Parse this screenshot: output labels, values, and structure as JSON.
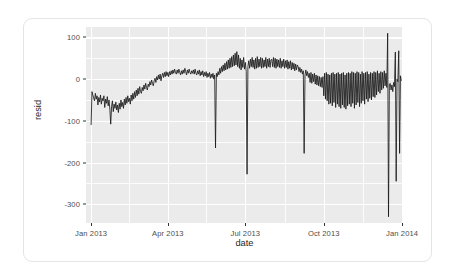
{
  "chart_data": {
    "type": "line",
    "title": "",
    "subtitle": "",
    "xlabel": "date",
    "ylabel": "resid",
    "grid": true,
    "legend": null,
    "xlim": [
      "2012-12-26",
      "2014-01-02"
    ],
    "ylim": [
      -345,
      125
    ],
    "yticks": [
      100,
      0,
      -100,
      -200,
      -300
    ],
    "ytick_labels": [
      "100",
      "0",
      "-100",
      "-200",
      "-300"
    ],
    "xticks": [
      "2013-01-01",
      "2013-04-01",
      "2013-07-01",
      "2013-10-01",
      "2014-01-01"
    ],
    "xtick_labels": [
      "Jan 2013",
      "Apr 2013",
      "Jul 2013",
      "Oct 2013",
      "Jan 2014"
    ],
    "panel_background": "#ebebeb",
    "gridline_color": "#ffffff",
    "line_color": "#1a1a1a",
    "series": [
      {
        "name": "resid",
        "x": [
          "2013-01-01",
          "2013-01-02",
          "2013-01-03",
          "2013-01-04",
          "2013-01-05",
          "2013-01-06",
          "2013-01-07",
          "2013-01-08",
          "2013-01-09",
          "2013-01-10",
          "2013-01-11",
          "2013-01-12",
          "2013-01-13",
          "2013-01-14",
          "2013-01-15",
          "2013-01-16",
          "2013-01-17",
          "2013-01-18",
          "2013-01-19",
          "2013-01-20",
          "2013-01-21",
          "2013-01-22",
          "2013-01-23",
          "2013-01-24",
          "2013-01-25",
          "2013-01-26",
          "2013-01-27",
          "2013-01-28",
          "2013-01-29",
          "2013-01-30",
          "2013-01-31",
          "2013-02-01",
          "2013-02-02",
          "2013-02-03",
          "2013-02-04",
          "2013-02-05",
          "2013-02-06",
          "2013-02-07",
          "2013-02-08",
          "2013-02-09",
          "2013-02-10",
          "2013-02-11",
          "2013-02-12",
          "2013-02-13",
          "2013-02-14",
          "2013-02-15",
          "2013-02-16",
          "2013-02-17",
          "2013-02-18",
          "2013-02-19",
          "2013-02-20",
          "2013-02-21",
          "2013-02-22",
          "2013-02-23",
          "2013-02-24",
          "2013-02-25",
          "2013-02-26",
          "2013-02-27",
          "2013-02-28",
          "2013-03-01",
          "2013-03-02",
          "2013-03-03",
          "2013-03-04",
          "2013-03-05",
          "2013-03-06",
          "2013-03-07",
          "2013-03-08",
          "2013-03-09",
          "2013-03-10",
          "2013-03-11",
          "2013-03-12",
          "2013-03-13",
          "2013-03-14",
          "2013-03-15",
          "2013-03-16",
          "2013-03-17",
          "2013-03-18",
          "2013-03-19",
          "2013-03-20",
          "2013-03-21",
          "2013-03-22",
          "2013-03-23",
          "2013-03-24",
          "2013-03-25",
          "2013-03-26",
          "2013-03-27",
          "2013-03-28",
          "2013-03-29",
          "2013-03-30",
          "2013-03-31",
          "2013-04-01",
          "2013-04-02",
          "2013-04-03",
          "2013-04-04",
          "2013-04-05",
          "2013-04-06",
          "2013-04-07",
          "2013-04-08",
          "2013-04-09",
          "2013-04-10",
          "2013-04-11",
          "2013-04-12",
          "2013-04-13",
          "2013-04-14",
          "2013-04-15",
          "2013-04-16",
          "2013-04-17",
          "2013-04-18",
          "2013-04-19",
          "2013-04-20",
          "2013-04-21",
          "2013-04-22",
          "2013-04-23",
          "2013-04-24",
          "2013-04-25",
          "2013-04-26",
          "2013-04-27",
          "2013-04-28",
          "2013-04-29",
          "2013-04-30",
          "2013-05-01",
          "2013-05-02",
          "2013-05-03",
          "2013-05-04",
          "2013-05-05",
          "2013-05-06",
          "2013-05-07",
          "2013-05-08",
          "2013-05-09",
          "2013-05-10",
          "2013-05-11",
          "2013-05-12",
          "2013-05-13",
          "2013-05-14",
          "2013-05-15",
          "2013-05-16",
          "2013-05-17",
          "2013-05-18",
          "2013-05-19",
          "2013-05-20",
          "2013-05-21",
          "2013-05-22",
          "2013-05-23",
          "2013-05-24",
          "2013-05-25",
          "2013-05-26",
          "2013-05-27",
          "2013-05-28",
          "2013-05-29",
          "2013-05-30",
          "2013-05-31",
          "2013-06-01",
          "2013-06-02",
          "2013-06-03",
          "2013-06-04",
          "2013-06-05",
          "2013-06-06",
          "2013-06-07",
          "2013-06-08",
          "2013-06-09",
          "2013-06-10",
          "2013-06-11",
          "2013-06-12",
          "2013-06-13",
          "2013-06-14",
          "2013-06-15",
          "2013-06-16",
          "2013-06-17",
          "2013-06-18",
          "2013-06-19",
          "2013-06-20",
          "2013-06-21",
          "2013-06-22",
          "2013-06-23",
          "2013-06-24",
          "2013-06-25",
          "2013-06-26",
          "2013-06-27",
          "2013-06-28",
          "2013-06-29",
          "2013-06-30",
          "2013-07-01",
          "2013-07-02",
          "2013-07-03",
          "2013-07-04",
          "2013-07-05",
          "2013-07-06",
          "2013-07-07",
          "2013-07-08",
          "2013-07-09",
          "2013-07-10",
          "2013-07-11",
          "2013-07-12",
          "2013-07-13",
          "2013-07-14",
          "2013-07-15",
          "2013-07-16",
          "2013-07-17",
          "2013-07-18",
          "2013-07-19",
          "2013-07-20",
          "2013-07-21",
          "2013-07-22",
          "2013-07-23",
          "2013-07-24",
          "2013-07-25",
          "2013-07-26",
          "2013-07-27",
          "2013-07-28",
          "2013-07-29",
          "2013-07-30",
          "2013-07-31",
          "2013-08-01",
          "2013-08-02",
          "2013-08-03",
          "2013-08-04",
          "2013-08-05",
          "2013-08-06",
          "2013-08-07",
          "2013-08-08",
          "2013-08-09",
          "2013-08-10",
          "2013-08-11",
          "2013-08-12",
          "2013-08-13",
          "2013-08-14",
          "2013-08-15",
          "2013-08-16",
          "2013-08-17",
          "2013-08-18",
          "2013-08-19",
          "2013-08-20",
          "2013-08-21",
          "2013-08-22",
          "2013-08-23",
          "2013-08-24",
          "2013-08-25",
          "2013-08-26",
          "2013-08-27",
          "2013-08-28",
          "2013-08-29",
          "2013-08-30",
          "2013-08-31",
          "2013-09-01",
          "2013-09-02",
          "2013-09-03",
          "2013-09-04",
          "2013-09-05",
          "2013-09-06",
          "2013-09-07",
          "2013-09-08",
          "2013-09-09",
          "2013-09-10",
          "2013-09-11",
          "2013-09-12",
          "2013-09-13",
          "2013-09-14",
          "2013-09-15",
          "2013-09-16",
          "2013-09-17",
          "2013-09-18",
          "2013-09-19",
          "2013-09-20",
          "2013-09-21",
          "2013-09-22",
          "2013-09-23",
          "2013-09-24",
          "2013-09-25",
          "2013-09-26",
          "2013-09-27",
          "2013-09-28",
          "2013-09-29",
          "2013-09-30",
          "2013-10-01",
          "2013-10-02",
          "2013-10-03",
          "2013-10-04",
          "2013-10-05",
          "2013-10-06",
          "2013-10-07",
          "2013-10-08",
          "2013-10-09",
          "2013-10-10",
          "2013-10-11",
          "2013-10-12",
          "2013-10-13",
          "2013-10-14",
          "2013-10-15",
          "2013-10-16",
          "2013-10-17",
          "2013-10-18",
          "2013-10-19",
          "2013-10-20",
          "2013-10-21",
          "2013-10-22",
          "2013-10-23",
          "2013-10-24",
          "2013-10-25",
          "2013-10-26",
          "2013-10-27",
          "2013-10-28",
          "2013-10-29",
          "2013-10-30",
          "2013-10-31",
          "2013-11-01",
          "2013-11-02",
          "2013-11-03",
          "2013-11-04",
          "2013-11-05",
          "2013-11-06",
          "2013-11-07",
          "2013-11-08",
          "2013-11-09",
          "2013-11-10",
          "2013-11-11",
          "2013-11-12",
          "2013-11-13",
          "2013-11-14",
          "2013-11-15",
          "2013-11-16",
          "2013-11-17",
          "2013-11-18",
          "2013-11-19",
          "2013-11-20",
          "2013-11-21",
          "2013-11-22",
          "2013-11-23",
          "2013-11-24",
          "2013-11-25",
          "2013-11-26",
          "2013-11-27",
          "2013-11-28",
          "2013-11-29",
          "2013-11-30",
          "2013-12-01",
          "2013-12-02",
          "2013-12-03",
          "2013-12-04",
          "2013-12-05",
          "2013-12-06",
          "2013-12-07",
          "2013-12-08",
          "2013-12-09",
          "2013-12-10",
          "2013-12-11",
          "2013-12-12",
          "2013-12-13",
          "2013-12-14",
          "2013-12-15",
          "2013-12-16",
          "2013-12-17",
          "2013-12-18",
          "2013-12-19",
          "2013-12-20",
          "2013-12-21",
          "2013-12-22",
          "2013-12-23",
          "2013-12-24",
          "2013-12-25",
          "2013-12-26",
          "2013-12-27",
          "2013-12-28",
          "2013-12-29",
          "2013-12-30",
          "2013-12-31"
        ],
        "values": [
          -110,
          -30,
          -38,
          -45,
          -52,
          -34,
          -48,
          -40,
          -62,
          -44,
          -55,
          -38,
          -60,
          -46,
          -52,
          -40,
          -68,
          -48,
          -58,
          -42,
          -64,
          -50,
          -72,
          -108,
          -66,
          -52,
          -78,
          -60,
          -70,
          -55,
          -74,
          -62,
          -80,
          -58,
          -72,
          -50,
          -66,
          -56,
          -70,
          -48,
          -62,
          -44,
          -58,
          -40,
          -54,
          -46,
          -60,
          -38,
          -52,
          -34,
          -48,
          -30,
          -44,
          -26,
          -40,
          -22,
          -36,
          -18,
          -30,
          -34,
          -20,
          -28,
          -14,
          -24,
          -10,
          -20,
          -26,
          -12,
          -18,
          -6,
          -14,
          -2,
          -10,
          -16,
          -4,
          2,
          -8,
          6,
          -2,
          10,
          0,
          12,
          -4,
          8,
          14,
          4,
          16,
          6,
          18,
          8,
          16,
          6,
          18,
          10,
          20,
          12,
          22,
          14,
          24,
          16,
          12,
          22,
          14,
          24,
          16,
          10,
          20,
          12,
          22,
          14,
          26,
          18,
          10,
          22,
          14,
          24,
          16,
          12,
          20,
          14,
          22,
          12,
          24,
          14,
          10,
          20,
          12,
          22,
          8,
          18,
          10,
          20,
          6,
          16,
          8,
          18,
          4,
          14,
          6,
          16,
          2,
          12,
          4,
          14,
          0,
          10,
          -165,
          14,
          6,
          18,
          10,
          26,
          14,
          30,
          18,
          34,
          20,
          38,
          22,
          42,
          24,
          46,
          26,
          50,
          28,
          54,
          30,
          58,
          32,
          62,
          34,
          66,
          30,
          58,
          26,
          50,
          22,
          46,
          28,
          52,
          24,
          40,
          18,
          -228,
          30,
          44,
          26,
          48,
          30,
          52,
          28,
          46,
          24,
          50,
          26,
          54,
          28,
          48,
          30,
          52,
          26,
          50,
          28,
          46,
          30,
          52,
          26,
          48,
          30,
          50,
          28,
          46,
          48,
          30,
          52,
          28,
          50,
          26,
          48,
          30,
          46,
          28,
          50,
          26,
          44,
          30,
          48,
          26,
          44,
          28,
          46,
          24,
          42,
          26,
          44,
          22,
          40,
          24,
          38,
          20,
          36,
          22,
          34,
          30,
          18,
          28,
          16,
          24,
          12,
          20,
          -178,
          10,
          22,
          8,
          18,
          4,
          14,
          -8,
          16,
          -10,
          12,
          -6,
          14,
          -12,
          10,
          -14,
          8,
          -16,
          6,
          -18,
          4,
          -20,
          6,
          -40,
          14,
          -48,
          16,
          -52,
          12,
          -60,
          10,
          -58,
          14,
          -64,
          16,
          -56,
          12,
          -68,
          14,
          -60,
          16,
          -66,
          12,
          -70,
          14,
          -62,
          16,
          -68,
          10,
          -72,
          14,
          -64,
          16,
          -60,
          14,
          -66,
          18,
          -58,
          16,
          -70,
          14,
          -62,
          18,
          -56,
          16,
          -66,
          12,
          -58,
          18,
          -52,
          14,
          -60,
          16,
          -48,
          18,
          -54,
          12,
          -46,
          16,
          -50,
          14,
          -42,
          18,
          -44,
          16,
          -38,
          20,
          -30,
          14,
          -34,
          18,
          -26,
          16,
          -22,
          20,
          -16,
          14,
          -20,
          110,
          -330,
          -12,
          -10,
          -26,
          -14,
          -30,
          -8,
          -18,
          65,
          -245,
          0,
          -6,
          68,
          -178,
          8,
          -4
        ]
      }
    ],
    "annotations": [
      {
        "label": "max spike",
        "value": 110,
        "date": "2013-12-24"
      },
      {
        "label": "min spike",
        "value": -330,
        "date": "2013-12-25"
      }
    ]
  }
}
